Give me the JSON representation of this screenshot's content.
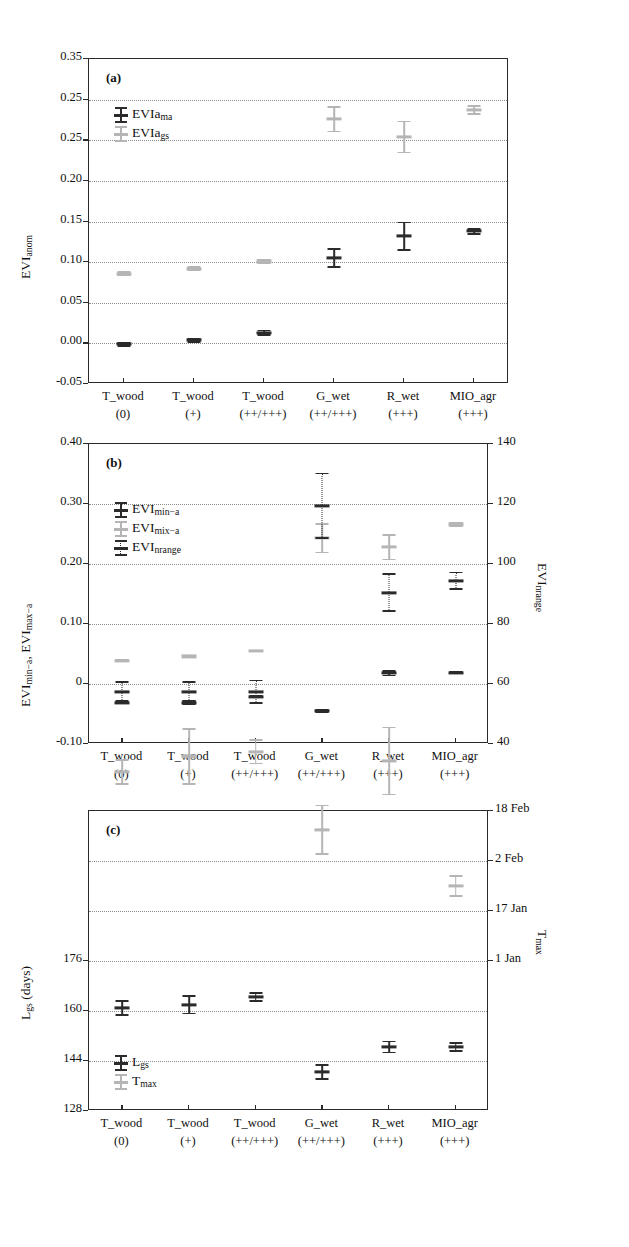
{
  "figure": {
    "title": "",
    "categories": [
      "T_wood",
      "T_wood",
      "T_wood",
      "G_wet",
      "R_wet",
      "MIO_agr"
    ],
    "category_levels": [
      "(0)",
      "(+)",
      "(++/+++)",
      "(++/+++)",
      "(+++)",
      "(+++)"
    ],
    "colors": {
      "dark": "#2b2b2b",
      "light": "#b5b5b5",
      "grid": "#8c8c8c",
      "axis": "#2a2a2a"
    }
  },
  "chart_data": [
    {
      "type": "scatter",
      "panel": "a",
      "panel_label": "(a)",
      "title": "",
      "xlabel": "",
      "ylabel": "EVI_anom",
      "ylabel_base": "EVI",
      "ylabel_sub": "anom",
      "ylim": [
        -0.05,
        0.35
      ],
      "yticks": [
        -0.05,
        0.0,
        0.05,
        0.1,
        0.15,
        0.2,
        0.25,
        0.35
      ],
      "ytick_labels": [
        "-0.05",
        "0.00",
        "0.05",
        "0.10",
        "0.15",
        "0.20",
        "0.25",
        "0.25",
        "0.35"
      ],
      "ytick_values": [
        -0.05,
        0.0,
        0.05,
        0.1,
        0.15,
        0.2,
        0.25,
        0.3,
        0.35
      ],
      "grid": true,
      "legend_position": "upper left",
      "categories": [
        "T_wood (0)",
        "T_wood (+)",
        "T_wood (++/+++)",
        "G_wet (++/+++)",
        "R_wet (+++)",
        "MIO_agr (+++)"
      ],
      "series": [
        {
          "name": "EVIa_ma",
          "name_base": "EVIa",
          "name_sub": "ma",
          "color": "#2b2b2b",
          "values": [
            -0.001,
            0.004,
            0.013,
            0.105,
            0.132,
            0.138
          ],
          "err_low": [
            0.003,
            0.003,
            0.004,
            0.012,
            0.018,
            0.004
          ],
          "err_high": [
            0.003,
            0.003,
            0.004,
            0.012,
            0.018,
            0.004
          ]
        },
        {
          "name": "EVIa_gs",
          "name_base": "EVIa",
          "name_sub": "gs",
          "color": "#b5b5b5",
          "values": [
            0.086,
            0.092,
            0.101,
            0.276,
            0.254,
            0.287
          ],
          "err_low": [
            0.003,
            0.003,
            0.003,
            0.016,
            0.02,
            0.006
          ],
          "err_high": [
            0.003,
            0.003,
            0.003,
            0.016,
            0.02,
            0.006
          ]
        }
      ]
    },
    {
      "type": "scatter",
      "panel": "b",
      "panel_label": "(b)",
      "title": "",
      "xlabel": "",
      "ylabel": "EVI_min-a , EVI_max-a",
      "ylabel_left_parts": [
        "EVI",
        "min−a",
        ", EVI",
        "max−a"
      ],
      "ylim": [
        -0.1,
        0.4
      ],
      "yticks": [
        -0.1,
        0.0,
        0.1,
        0.2,
        0.3,
        0.4
      ],
      "ytick_labels": [
        "-0.10",
        "0",
        "0.10",
        "0.20",
        "0.30",
        "0.40"
      ],
      "ylabel_right": "EVI_nrange",
      "ylabel_right_base": "EVI",
      "ylabel_right_sub": "nrange",
      "ylim_right": [
        40,
        140
      ],
      "yticks_right": [
        40,
        60,
        80,
        100,
        120,
        140
      ],
      "ytick_labels_right": [
        "40",
        "60",
        "80",
        "100",
        "120",
        "140"
      ],
      "grid": true,
      "legend_position": "upper left",
      "categories": [
        "T_wood (0)",
        "T_wood (+)",
        "T_wood (++/+++)",
        "G_wet (++/+++)",
        "R_wet (+++)",
        "MIO_agr (+++)"
      ],
      "series": [
        {
          "name": "EVI_min-a",
          "name_base": "EVI",
          "name_sub": "min−a",
          "color": "#2b2b2b",
          "axis": "left",
          "values": [
            -0.032,
            -0.031,
            -0.021,
            -0.045,
            0.018,
            0.019
          ],
          "err_low": [
            0.002,
            0.004,
            0.002,
            0.003,
            0.005,
            0.002
          ],
          "err_high": [
            0.002,
            0.004,
            0.002,
            0.003,
            0.005,
            0.002
          ]
        },
        {
          "name": "EVI_mix-a",
          "name_base": "EVI",
          "name_sub": "mix−a",
          "color": "#b5b5b5",
          "axis": "left",
          "values": [
            0.039,
            0.046,
            0.055,
            0.243,
            0.228,
            0.266
          ],
          "err_low": [
            0.002,
            0.002,
            0.002,
            0.025,
            0.022,
            0.004
          ],
          "err_high": [
            0.002,
            0.002,
            0.002,
            0.025,
            0.022,
            0.004
          ]
        },
        {
          "name": "EVI_nrange",
          "name_base": "EVI",
          "name_sub": "nrange",
          "color": "#2b2b2b",
          "style": "dotted",
          "axis": "right",
          "values": [
            57.5,
            57.5,
            57.5,
            119.5,
            90.5,
            94.5
          ],
          "err_low": [
            3.5,
            3.5,
            4.0,
            11.0,
            6.5,
            3.0
          ],
          "err_high": [
            3.5,
            3.5,
            4.0,
            11.0,
            6.5,
            3.0
          ]
        }
      ]
    },
    {
      "type": "scatter",
      "panel": "c",
      "panel_label": "(c)",
      "title": "",
      "xlabel": "",
      "ylabel": "L_gs (days)",
      "ylabel_base": "L",
      "ylabel_sub": "gs",
      "ylabel_tail": " (days)",
      "ylim": [
        128,
        224
      ],
      "yticks": [
        128,
        144,
        160,
        176
      ],
      "ytick_labels": [
        "128",
        "144",
        "160",
        "176"
      ],
      "ylabel_right": "T_max",
      "ylabel_right_base": "T",
      "ylabel_right_sub": "max",
      "ytick_labels_right": [
        "1 Jan",
        "17 Jan",
        "2 Feb",
        "18 Feb",
        "6 Mar",
        "22 Mar"
      ],
      "yticks_right_positions": [
        176,
        192,
        208,
        224,
        240,
        256
      ],
      "grid": true,
      "legend_position": "lower left",
      "categories": [
        "T_wood (0)",
        "T_wood (+)",
        "T_wood (++/+++)",
        "G_wet (++/+++)",
        "R_wet (+++)",
        "MIO_agr (+++)"
      ],
      "series": [
        {
          "name": "L_gs",
          "name_base": "L",
          "name_sub": "gs",
          "color": "#2b2b2b",
          "values": [
            161.0,
            162.0,
            164.5,
            140.5,
            148.5,
            148.5
          ],
          "err_low": [
            2.5,
            3.0,
            1.5,
            2.5,
            2.0,
            1.5
          ],
          "err_high": [
            2.5,
            3.0,
            1.5,
            2.5,
            2.0,
            1.5
          ]
        },
        {
          "name": "T_max",
          "name_base": "T",
          "name_sub": "max",
          "color": "#b5b5b5",
          "values": [
            236.5,
            241.5,
            243.0,
            218.0,
            240.0,
            200.0
          ],
          "err_low": [
            4.0,
            9.0,
            4.0,
            8.0,
            11.0,
            3.5
          ],
          "err_high": [
            4.0,
            9.0,
            4.0,
            8.0,
            11.0,
            3.5
          ]
        }
      ]
    }
  ]
}
